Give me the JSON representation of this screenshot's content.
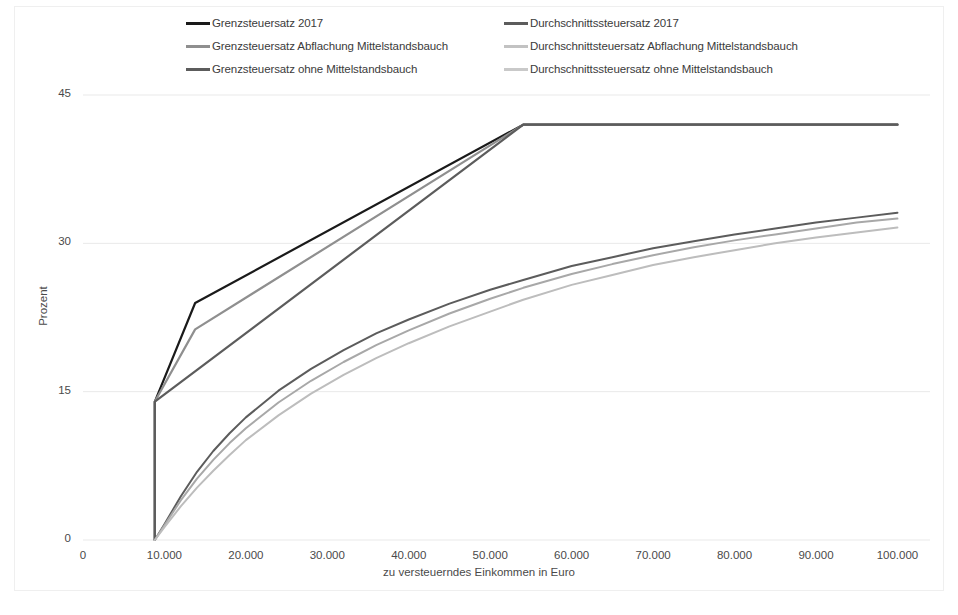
{
  "chart_data": {
    "type": "line",
    "title": "",
    "xlabel": "zu versteuerndes Einkommen in Euro",
    "ylabel": "Prozent",
    "xlim": [
      0,
      104000
    ],
    "ylim": [
      0,
      46
    ],
    "xticks": [
      "0",
      "10.000",
      "20.000",
      "30.000",
      "40.000",
      "50.000",
      "60.000",
      "70.000",
      "80.000",
      "90.000",
      "100.000"
    ],
    "xtick_values": [
      0,
      10000,
      20000,
      30000,
      40000,
      50000,
      60000,
      70000,
      80000,
      90000,
      100000
    ],
    "yticks": [
      "0",
      "15",
      "30",
      "45"
    ],
    "ytick_values": [
      0,
      15,
      30,
      45
    ],
    "grid": "horizontal",
    "legend_position": "top",
    "series": [
      {
        "name": "Grenzsteuersatz 2017",
        "color": "#1a1a1a",
        "width": 2.2,
        "points": [
          [
            8820,
            0
          ],
          [
            8820,
            14.0
          ],
          [
            13769,
            23.97
          ],
          [
            54057,
            42.0
          ],
          [
            100000,
            42.0
          ]
        ]
      },
      {
        "name": "Grenzsteuersatz Abflachung Mittelstandsbauch",
        "color": "#8f8f8f",
        "width": 2.2,
        "points": [
          [
            8820,
            0
          ],
          [
            8820,
            14.0
          ],
          [
            13769,
            21.3
          ],
          [
            54057,
            42.0
          ],
          [
            100000,
            42.0
          ]
        ]
      },
      {
        "name": "Grenzsteuersatz ohne Mittelstandsbauch",
        "color": "#5c5c5c",
        "width": 2.2,
        "points": [
          [
            8820,
            0
          ],
          [
            8820,
            14.0
          ],
          [
            54057,
            42.0
          ],
          [
            100000,
            42.0
          ]
        ]
      },
      {
        "name": "Durchschnittssteuersatz 2017",
        "color": "#5c5c5c",
        "width": 2.0,
        "points": [
          [
            8820,
            0
          ],
          [
            10000,
            1.6
          ],
          [
            12000,
            4.4
          ],
          [
            14000,
            6.9
          ],
          [
            16000,
            9.0
          ],
          [
            18000,
            10.8
          ],
          [
            20000,
            12.4
          ],
          [
            24000,
            15.1
          ],
          [
            28000,
            17.3
          ],
          [
            32000,
            19.2
          ],
          [
            36000,
            20.9
          ],
          [
            40000,
            22.3
          ],
          [
            45000,
            23.9
          ],
          [
            50000,
            25.3
          ],
          [
            54057,
            26.3
          ],
          [
            60000,
            27.7
          ],
          [
            65000,
            28.6
          ],
          [
            70000,
            29.5
          ],
          [
            75000,
            30.2
          ],
          [
            80000,
            30.9
          ],
          [
            85000,
            31.5
          ],
          [
            90000,
            32.1
          ],
          [
            95000,
            32.6
          ],
          [
            100000,
            33.1
          ]
        ]
      },
      {
        "name": "Durchschnittsteuersatz Abflachung Mittelstandsbauch",
        "color": "#a8a8a8",
        "width": 2.0,
        "points": [
          [
            8820,
            0
          ],
          [
            10000,
            1.5
          ],
          [
            12000,
            4.0
          ],
          [
            14000,
            6.2
          ],
          [
            16000,
            8.1
          ],
          [
            18000,
            9.8
          ],
          [
            20000,
            11.3
          ],
          [
            24000,
            13.9
          ],
          [
            28000,
            16.1
          ],
          [
            32000,
            18.0
          ],
          [
            36000,
            19.7
          ],
          [
            40000,
            21.2
          ],
          [
            45000,
            22.9
          ],
          [
            50000,
            24.4
          ],
          [
            54057,
            25.5
          ],
          [
            60000,
            26.9
          ],
          [
            65000,
            27.9
          ],
          [
            70000,
            28.8
          ],
          [
            75000,
            29.6
          ],
          [
            80000,
            30.3
          ],
          [
            85000,
            30.9
          ],
          [
            90000,
            31.5
          ],
          [
            95000,
            32.1
          ],
          [
            100000,
            32.5
          ]
        ]
      },
      {
        "name": "Durchschnittssteuersatz ohne Mittelstandsbauch",
        "color": "#bdbdbd",
        "width": 2.0,
        "points": [
          [
            8820,
            0
          ],
          [
            10000,
            1.3
          ],
          [
            12000,
            3.4
          ],
          [
            14000,
            5.3
          ],
          [
            16000,
            7.0
          ],
          [
            18000,
            8.6
          ],
          [
            20000,
            10.1
          ],
          [
            24000,
            12.6
          ],
          [
            28000,
            14.8
          ],
          [
            32000,
            16.7
          ],
          [
            36000,
            18.4
          ],
          [
            40000,
            19.9
          ],
          [
            45000,
            21.6
          ],
          [
            50000,
            23.1
          ],
          [
            54057,
            24.3
          ],
          [
            60000,
            25.8
          ],
          [
            65000,
            26.8
          ],
          [
            70000,
            27.8
          ],
          [
            75000,
            28.6
          ],
          [
            80000,
            29.3
          ],
          [
            85000,
            30.0
          ],
          [
            90000,
            30.6
          ],
          [
            95000,
            31.1
          ],
          [
            100000,
            31.6
          ]
        ]
      }
    ]
  },
  "legend": {
    "items": [
      {
        "label": "Grenzsteuersatz 2017",
        "color": "#1a1a1a"
      },
      {
        "label": "Durchschnittssteuersatz 2017",
        "color": "#5c5c5c"
      },
      {
        "label": "Grenzsteuersatz Abflachung Mittelstandsbauch",
        "color": "#8f8f8f"
      },
      {
        "label": "Durchschnittsteuersatz Abflachung Mittelstandsbauch",
        "color": "#a8a8a8"
      },
      {
        "label": "Grenzsteuersatz ohne Mittelstandsbauch",
        "color": "#5c5c5c"
      },
      {
        "label": "Durchschnittssteuersatz ohne Mittelstandsbauch",
        "color": "#bdbdbd"
      }
    ]
  },
  "axes": {
    "y_label": "Prozent",
    "x_label": "zu versteuerndes Einkommen in Euro",
    "y_ticks": [
      "45",
      "30",
      "15",
      "0"
    ],
    "x_ticks": [
      "0",
      "10.000",
      "20.000",
      "30.000",
      "40.000",
      "50.000",
      "60.000",
      "70.000",
      "80.000",
      "90.000",
      "100.000"
    ]
  }
}
